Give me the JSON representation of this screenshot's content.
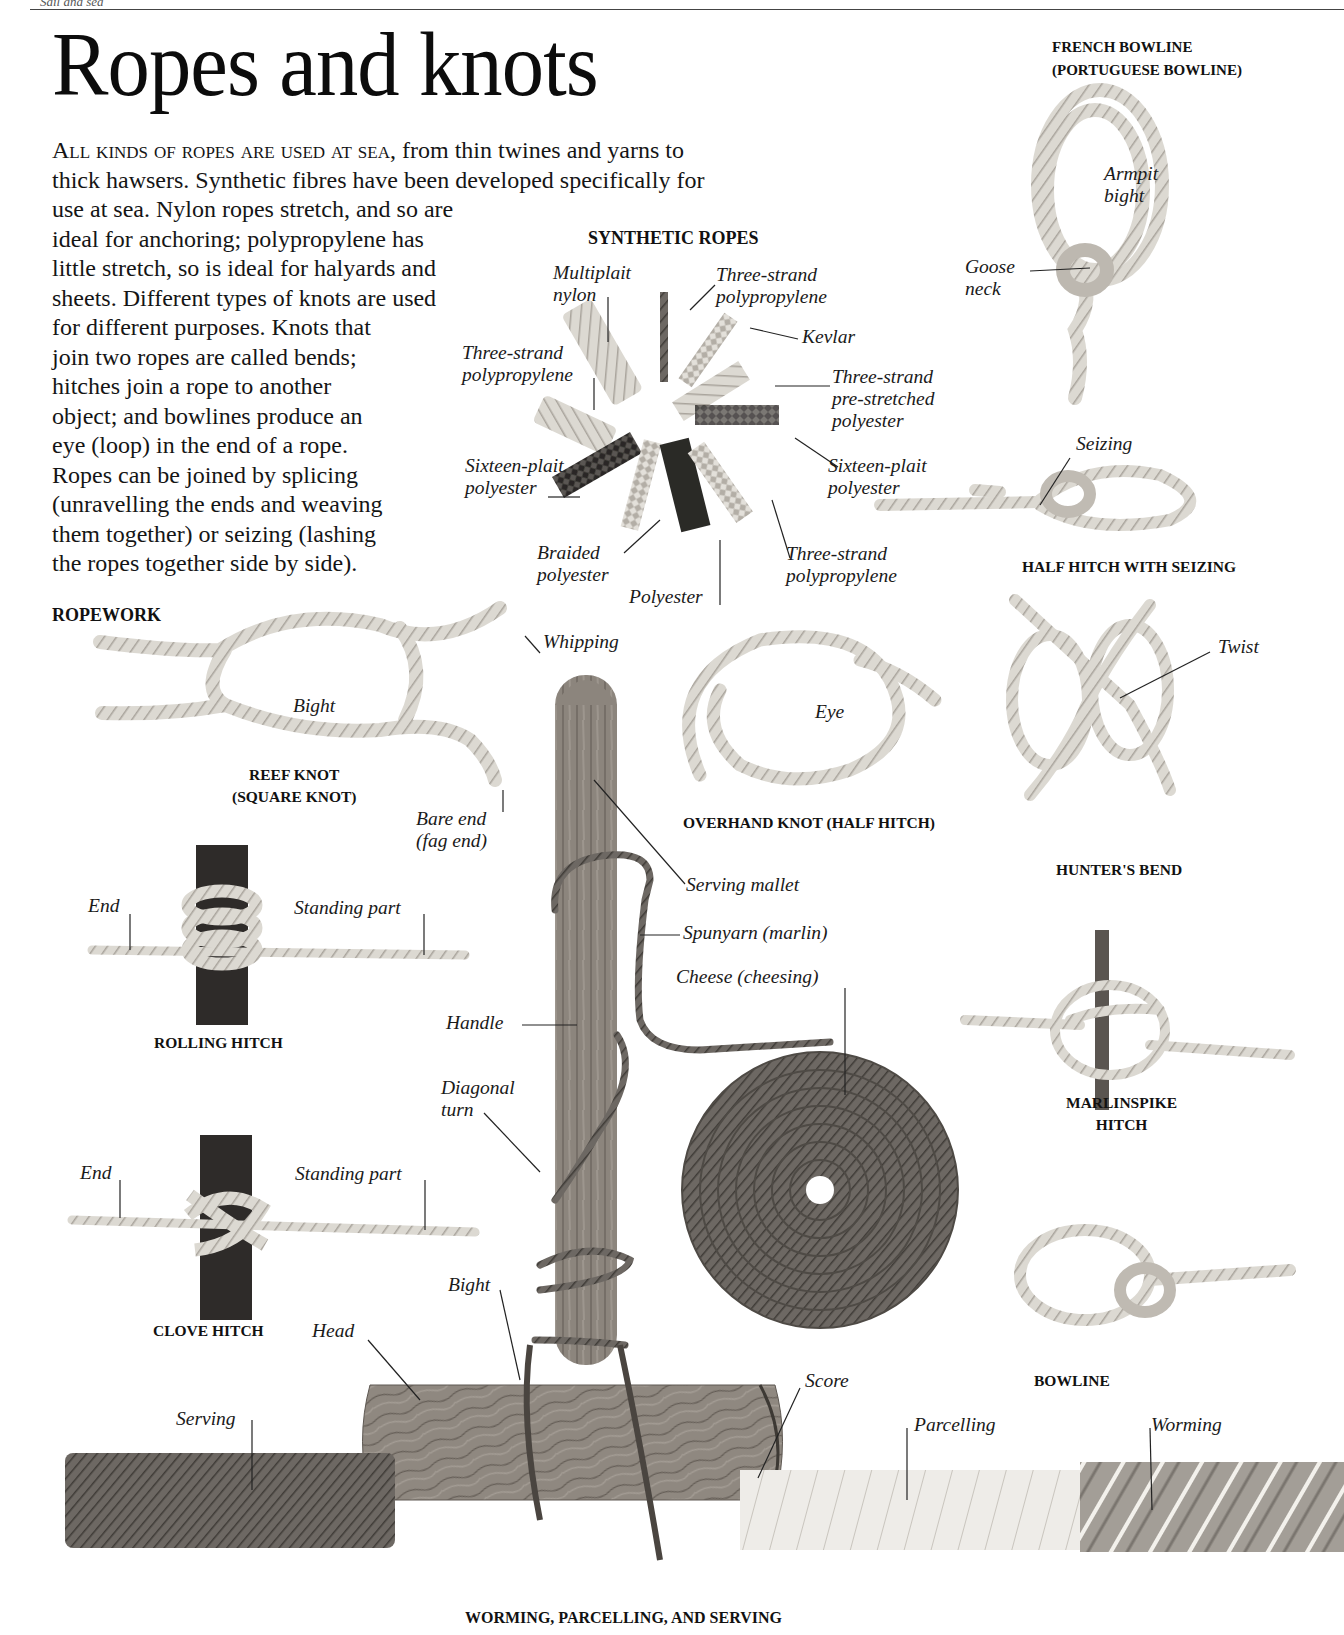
{
  "page": {
    "running_head": "Sail and sea",
    "title": "Ropes and knots",
    "intro": {
      "lead_caps": "All kinds of ropes are used at sea",
      "lines": [
        ", from thin twines and yarns to",
        "thick hawsers. Synthetic fibres have been developed specifically for",
        "use at sea. Nylon ropes stretch, and so are",
        "ideal for anchoring; polypropylene has",
        "little stretch, so is ideal for halyards and",
        "sheets. Different types of knots are used",
        "for different purposes. Knots that",
        "join two ropes are called bends;",
        "hitches join a rope to another",
        "object; and bowlines produce an",
        "eye (loop) in the end of a rope.",
        "Ropes can be joined by splicing",
        "(unravelling the ends and weaving",
        "them together) or seizing (lashing",
        "the ropes together side by side)."
      ]
    }
  },
  "synthetic_ropes": {
    "heading": "SYNTHETIC ROPES",
    "labels": {
      "multiplait_nylon": [
        "Multiplait",
        "nylon"
      ],
      "three_strand_pp_top": [
        "Three-strand",
        "polypropylene"
      ],
      "kevlar": [
        "Kevlar"
      ],
      "three_strand_pre_stretched": [
        "Three-strand",
        "pre-stretched",
        "polyester"
      ],
      "three_strand_pp_left": [
        "Three-strand",
        "polypropylene"
      ],
      "sixteen_plait_left": [
        "Sixteen-plait",
        "polyester"
      ],
      "sixteen_plait_right": [
        "Sixteen-plait",
        "polyester"
      ],
      "braided_polyester": [
        "Braided",
        "polyester"
      ],
      "polyester": [
        "Polyester"
      ],
      "three_strand_pp_bottom": [
        "Three-strand",
        "polypropylene"
      ]
    }
  },
  "french_bowline": {
    "caption": [
      "FRENCH BOWLINE",
      "(PORTUGUESE BOWLINE)"
    ],
    "labels": {
      "armpit_bight": [
        "Armpit",
        "bight"
      ],
      "goose_neck": [
        "Goose",
        "neck"
      ]
    }
  },
  "half_hitch_seizing": {
    "caption": "HALF HITCH WITH SEIZING",
    "labels": {
      "seizing": "Seizing"
    }
  },
  "ropework": {
    "heading": "ROPEWORK",
    "reef_knot": {
      "caption": [
        "REEF KNOT",
        "(SQUARE KNOT)"
      ],
      "labels": {
        "bight": "Bight",
        "whipping": "Whipping",
        "bare_end": [
          "Bare end",
          "(fag end)"
        ]
      }
    },
    "overhand_knot": {
      "caption": "OVERHAND KNOT (HALF HITCH)",
      "labels": {
        "eye": "Eye"
      }
    },
    "hunters_bend": {
      "caption": "HUNTER'S BEND",
      "labels": {
        "twist": "Twist"
      }
    },
    "rolling_hitch": {
      "caption": "ROLLING HITCH",
      "labels": {
        "end": "End",
        "standing_part": "Standing part"
      }
    },
    "clove_hitch": {
      "caption": "CLOVE HITCH",
      "labels": {
        "end": "End",
        "standing_part": "Standing part"
      }
    },
    "marlinspike_hitch": {
      "caption": [
        "MARLINSPIKE",
        "HITCH"
      ]
    },
    "bowline": {
      "caption": "BOWLINE"
    },
    "serving_mallet": {
      "labels": {
        "serving_mallet": "Serving mallet",
        "spunyarn": "Spunyarn (marlin)",
        "cheese": "Cheese (cheesing)",
        "handle": "Handle",
        "diagonal_turn": [
          "Diagonal",
          "turn"
        ],
        "bight": "Bight",
        "head": "Head",
        "score": "Score"
      }
    },
    "worming_parcelling_serving": {
      "caption": "WORMING, PARCELLING, AND SERVING",
      "labels": {
        "serving": "Serving",
        "parcelling": "Parcelling",
        "worming": "Worming"
      }
    }
  },
  "colors": {
    "background": "#ffffff",
    "text": "#111111",
    "rope_light": "#d9d6cf",
    "rope_dark": "#6a6560",
    "wood": "#8a837c",
    "spunyarn": "#5e5953",
    "dark_post": "#2f2c2a"
  }
}
